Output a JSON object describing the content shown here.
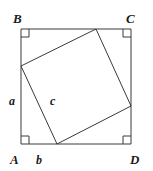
{
  "figure": {
    "type": "geometry-diagram",
    "background_color": "#ffffff",
    "stroke_color": "#3a3a3a",
    "stroke_width": 1,
    "canvas": {
      "width": 153,
      "height": 171
    }
  },
  "outer_square": {
    "name": "square-ABCD",
    "corners": {
      "top_left": {
        "x": 21,
        "y": 29
      },
      "top_right": {
        "x": 131,
        "y": 29
      },
      "bottom_right": {
        "x": 131,
        "y": 144
      },
      "bottom_left": {
        "x": 21,
        "y": 144
      }
    },
    "points_path": "21,29 131,29 131,144 21,144"
  },
  "inner_square": {
    "name": "inscribed-tilted-square",
    "vertices": {
      "left": {
        "x": 21,
        "y": 66
      },
      "top": {
        "x": 96,
        "y": 29
      },
      "right": {
        "x": 131,
        "y": 106
      },
      "bottom": {
        "x": 57,
        "y": 144
      }
    },
    "points_path": "21,66 96,29 131,106 57,144"
  },
  "right_angle_marks": [
    {
      "name": "right-angle-mark-B",
      "x": 21,
      "y": 29,
      "dx": 1,
      "dy": 1,
      "size": 8
    },
    {
      "name": "right-angle-mark-C",
      "x": 131,
      "y": 29,
      "dx": -1,
      "dy": 1,
      "size": 8
    },
    {
      "name": "right-angle-mark-D",
      "x": 131,
      "y": 144,
      "dx": -1,
      "dy": -1,
      "size": 8
    },
    {
      "name": "right-angle-mark-A",
      "x": 21,
      "y": 144,
      "dx": 1,
      "dy": -1,
      "size": 8
    }
  ],
  "labels": {
    "vertices": [
      {
        "id": "B",
        "text": "B",
        "left": 13,
        "top": 12
      },
      {
        "id": "C",
        "text": "C",
        "left": 126,
        "top": 12
      },
      {
        "id": "A",
        "text": "A",
        "left": 10,
        "top": 153
      },
      {
        "id": "D",
        "text": "D",
        "left": 130,
        "top": 153
      }
    ],
    "sides": [
      {
        "id": "a",
        "text": "a",
        "left": 9,
        "top": 95
      },
      {
        "id": "b",
        "text": "b",
        "left": 36,
        "top": 154
      },
      {
        "id": "c",
        "text": "c",
        "left": 50,
        "top": 95
      }
    ]
  }
}
